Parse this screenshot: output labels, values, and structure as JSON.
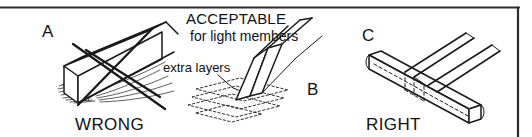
{
  "figure": {
    "frame_color": "#2b2b2b",
    "line_color": "#1a1a1a",
    "background_color": "#ffffff"
  },
  "panels": [
    {
      "id": "a",
      "letter": "A",
      "verdict": "WRONG",
      "description": "Beam bearing on a crushed, splintered support shown crossed out"
    },
    {
      "id": "b",
      "letter": "B",
      "verdict": "",
      "heading": "ACCEPTABLE",
      "subheading": "for light members",
      "callout": "extra layers",
      "description": "Tapered light member resting on stacked extra layers"
    },
    {
      "id": "c",
      "letter": "C",
      "verdict": "RIGHT",
      "description": "Beam properly seated on a full bearing member"
    }
  ]
}
